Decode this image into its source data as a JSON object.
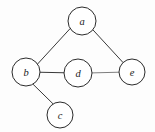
{
  "figure": {
    "name": "undirected-graph",
    "background_color": "#fdfdfd",
    "width": 155,
    "height": 132
  },
  "chart_data": {
    "type": "diagram",
    "diagram_kind": "undirected-graph",
    "title": "",
    "node_count": 5,
    "edge_count": 5,
    "nodes": [
      {
        "id": "a",
        "label": "a",
        "cx": 82,
        "cy": 21,
        "r": 14,
        "stroke": "#2b2b2b",
        "stroke_width": 1.0,
        "fill": "#ffffff"
      },
      {
        "id": "b",
        "label": "b",
        "cx": 26,
        "cy": 72,
        "r": 14,
        "stroke": "#2b2b2b",
        "stroke_width": 1.0,
        "fill": "#ffffff"
      },
      {
        "id": "d",
        "label": "d",
        "cx": 78,
        "cy": 73,
        "r": 14,
        "stroke": "#2b2b2b",
        "stroke_width": 1.0,
        "fill": "#ffffff"
      },
      {
        "id": "e",
        "label": "e",
        "cx": 132,
        "cy": 72,
        "r": 13,
        "stroke": "#2b2b2b",
        "stroke_width": 1.0,
        "fill": "#ffffff"
      },
      {
        "id": "c",
        "label": "c",
        "cx": 60,
        "cy": 115,
        "r": 13,
        "stroke": "#2b2b2b",
        "stroke_width": 1.0,
        "fill": "#ffffff"
      }
    ],
    "edges": [
      {
        "id": "a-b",
        "source": "a",
        "target": "b",
        "x1": 70.2,
        "y1": 28.5,
        "x2": 37.4,
        "y2": 64.2,
        "stroke": "#3a3a3a",
        "stroke_width": 1.0
      },
      {
        "id": "a-e",
        "source": "a",
        "target": "e",
        "x1": 93.0,
        "y1": 29.9,
        "x2": 123.0,
        "y2": 62.5,
        "stroke": "#3a3a3a",
        "stroke_width": 1.0
      },
      {
        "id": "b-d",
        "source": "b",
        "target": "d",
        "x1": 40.0,
        "y1": 72.3,
        "x2": 64.0,
        "y2": 72.8,
        "stroke": "#3a3a3a",
        "stroke_width": 1.1
      },
      {
        "id": "b-c",
        "source": "b",
        "target": "c",
        "x1": 33.0,
        "y1": 84.2,
        "x2": 53.2,
        "y2": 104.0,
        "stroke": "#3a3a3a",
        "stroke_width": 1.0
      },
      {
        "id": "d-e",
        "source": "d",
        "target": "e",
        "x1": 92.0,
        "y1": 72.9,
        "x2": 119.0,
        "y2": 72.2,
        "stroke": "#7e7e7e",
        "stroke_width": 1.0
      }
    ],
    "adjacency": {
      "a": [
        "b",
        "e"
      ],
      "b": [
        "a",
        "d",
        "c"
      ],
      "c": [
        "b"
      ],
      "d": [
        "b",
        "e"
      ],
      "e": [
        "a",
        "d"
      ]
    },
    "labels": {
      "a": "a",
      "b": "b",
      "c": "c",
      "d": "d",
      "e": "e"
    }
  }
}
